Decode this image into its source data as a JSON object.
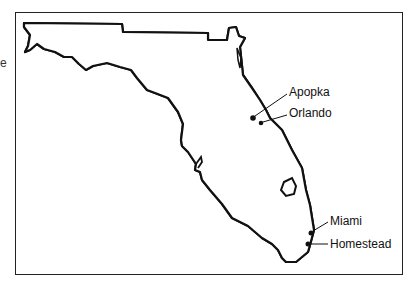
{
  "map": {
    "region": "Florida",
    "cut_off_text": "e",
    "shaded_region": "Central & South Florida (hatched)",
    "cities": [
      {
        "name": "Apopka"
      },
      {
        "name": "Orlando"
      },
      {
        "name": "Miami"
      },
      {
        "name": "Homestead"
      }
    ]
  }
}
